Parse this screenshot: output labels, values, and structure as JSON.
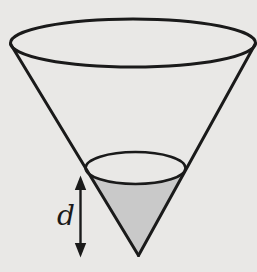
{
  "figure": {
    "type": "geometry-diagram",
    "label": {
      "text": "d",
      "color": "#1a1a1a"
    },
    "colors": {
      "background": "#e9e8e6",
      "line": "#1a1a1a",
      "shaded_fill": "#c9c9c9"
    },
    "icons": {
      "depth_arrow": "double-headed-vertical-arrow"
    }
  }
}
